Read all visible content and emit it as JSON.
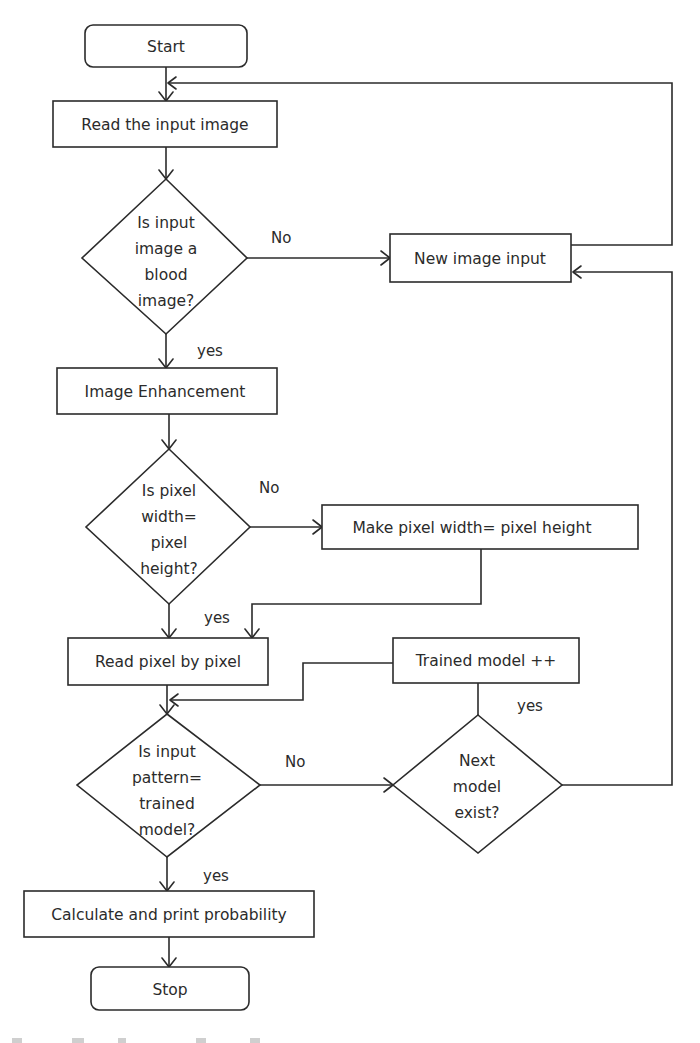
{
  "diagram": {
    "type": "flowchart",
    "colors": {
      "stroke": "#2b2b2b",
      "background": "#ffffff",
      "text": "#2b2b2b"
    },
    "nodes": {
      "start": {
        "label": "Start",
        "shape": "rounded-rect"
      },
      "read_input": {
        "label": "Read the input image",
        "shape": "rect"
      },
      "is_blood": {
        "lines": [
          "Is input",
          "image a",
          "blood",
          "image?"
        ],
        "shape": "diamond"
      },
      "new_image": {
        "label": "New image input",
        "shape": "rect"
      },
      "enhance": {
        "label": "Image Enhancement",
        "shape": "rect"
      },
      "is_square": {
        "lines": [
          "Is pixel",
          "width=",
          "pixel",
          "height?"
        ],
        "shape": "diamond"
      },
      "make_square": {
        "label": "Make pixel width= pixel height",
        "shape": "rect"
      },
      "read_pixels": {
        "label": "Read pixel by pixel",
        "shape": "rect"
      },
      "trained_inc": {
        "label": "Trained model ++",
        "shape": "rect"
      },
      "is_match": {
        "lines": [
          "Is input",
          "pattern=",
          "trained",
          "model?"
        ],
        "shape": "diamond"
      },
      "next_model": {
        "lines": [
          "Next",
          "model",
          "exist?"
        ],
        "shape": "diamond"
      },
      "calculate": {
        "label": "Calculate and print probability",
        "shape": "rect"
      },
      "stop": {
        "label": "Stop",
        "shape": "rounded-rect"
      }
    },
    "edge_labels": {
      "blood_no": "No",
      "blood_yes": "yes",
      "square_no": "No",
      "square_yes": "yes",
      "match_no": "No",
      "match_yes": "yes",
      "next_yes": "yes"
    },
    "edges": [
      {
        "from": "start",
        "to": "read_input"
      },
      {
        "from": "read_input",
        "to": "is_blood"
      },
      {
        "from": "is_blood",
        "to": "new_image",
        "label": "No"
      },
      {
        "from": "new_image",
        "to": "read_input"
      },
      {
        "from": "is_blood",
        "to": "enhance",
        "label": "yes"
      },
      {
        "from": "enhance",
        "to": "is_square"
      },
      {
        "from": "is_square",
        "to": "make_square",
        "label": "No"
      },
      {
        "from": "make_square",
        "to": "read_pixels"
      },
      {
        "from": "is_square",
        "to": "read_pixels",
        "label": "yes"
      },
      {
        "from": "read_pixels",
        "to": "is_match"
      },
      {
        "from": "is_match",
        "to": "next_model",
        "label": "No"
      },
      {
        "from": "next_model",
        "to": "trained_inc",
        "label": "yes"
      },
      {
        "from": "trained_inc",
        "to": "is_match"
      },
      {
        "from": "next_model",
        "to": "new_image"
      },
      {
        "from": "is_match",
        "to": "calculate",
        "label": "yes"
      },
      {
        "from": "calculate",
        "to": "stop"
      }
    ]
  }
}
